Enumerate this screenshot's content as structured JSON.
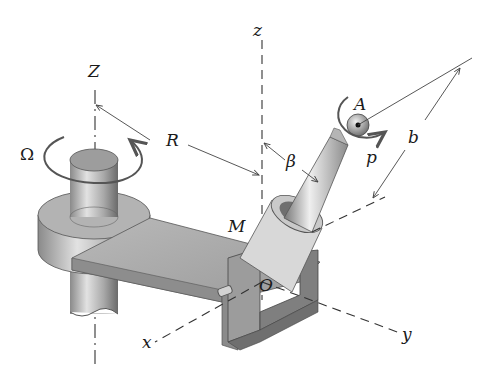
{
  "figure": {
    "type": "mechanics-diagram"
  },
  "labels": {
    "Z_axis": "Z",
    "z_axis": "z",
    "x_axis": "x",
    "y_axis": "y",
    "origin": "O",
    "point_M": "M",
    "point_A": "A",
    "radius": "R",
    "angle": "β",
    "length": "b",
    "spin_rate": "p",
    "angular_velocity": "Ω"
  },
  "colors": {
    "background": "#ffffff",
    "line": "#333333",
    "metal_light": "#d9d9d9",
    "metal_mid": "#a8a8a8",
    "metal_dark": "#6e6e6e"
  }
}
